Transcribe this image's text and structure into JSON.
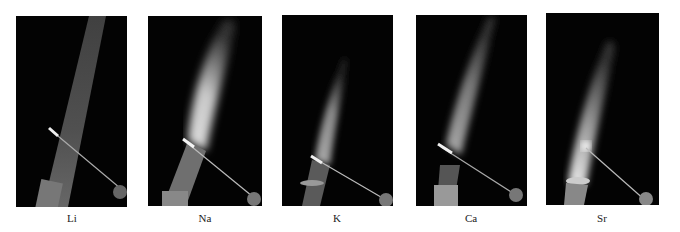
{
  "figure": {
    "panels": [
      {
        "id": "li",
        "label": "Li",
        "flame": "narrow dim streak"
      },
      {
        "id": "na",
        "label": "Na",
        "flame": "broad bright flame"
      },
      {
        "id": "k",
        "label": "K",
        "flame": "short soft flame"
      },
      {
        "id": "ca",
        "label": "Ca",
        "flame": "medium diffuse flame"
      },
      {
        "id": "sr",
        "label": "Sr",
        "flame": "bright-based plume"
      }
    ]
  }
}
